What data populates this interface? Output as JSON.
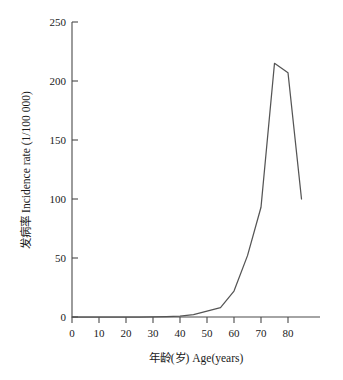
{
  "chart_data": {
    "type": "line",
    "title": "",
    "xlabel": "年龄(岁) Age(years)",
    "ylabel": "发病率 Incidence rate (1/100 000)",
    "xlim": [
      0,
      87
    ],
    "ylim": [
      0,
      250
    ],
    "xticks": [
      0,
      10,
      20,
      30,
      40,
      50,
      60,
      70,
      80
    ],
    "yticks": [
      0,
      50,
      100,
      150,
      200,
      250
    ],
    "xtick_labels": [
      "0",
      "10",
      "20",
      "30",
      "40",
      "50",
      "60",
      "70",
      "80"
    ],
    "ytick_labels": [
      "0",
      "50",
      "100",
      "150",
      "200",
      "250"
    ],
    "grid": false,
    "legend": false,
    "legend_position": "none",
    "line_color": "#555555",
    "series": [
      {
        "name": "Incidence rate",
        "x": [
          0,
          5,
          10,
          15,
          20,
          25,
          30,
          35,
          40,
          45,
          50,
          55,
          60,
          65,
          70,
          75,
          80,
          85
        ],
        "values": [
          0,
          0,
          0,
          0,
          0,
          0,
          0.2,
          0.4,
          0.8,
          2,
          5,
          8,
          22,
          52,
          93,
          215,
          207,
          100
        ]
      }
    ]
  },
  "axes": {
    "x_axis_name": "age-axis",
    "y_axis_name": "incidence-axis"
  }
}
